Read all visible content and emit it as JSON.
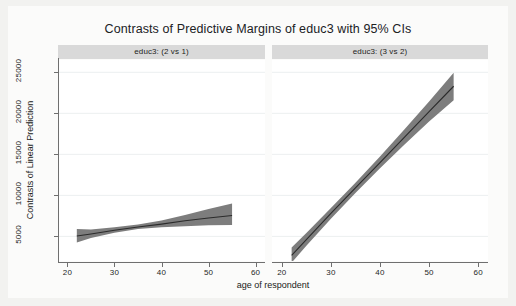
{
  "chart_data": {
    "type": "line",
    "title": "Contrasts of Predictive Margins of educ3 with 95% CIs",
    "xlabel": "age of respondent",
    "ylabel": "Contrasts of Linear Prediction",
    "xlim": [
      18,
      62
    ],
    "ylim": [
      2000,
      26500
    ],
    "xticks": [
      20,
      30,
      40,
      50,
      60
    ],
    "xtick_labels": [
      "20",
      "30",
      "40",
      "50",
      "60"
    ],
    "yticks": [
      5000,
      10000,
      15000,
      20000,
      25000
    ],
    "ytick_labels": [
      "5000",
      "10000",
      "15000",
      "20000",
      "25000"
    ],
    "grid": "horizontal-faint",
    "legend": "none",
    "band_color": "#7d7d7d",
    "line_color": "#2b2b2b",
    "panel_header_bg": "#d9d9d9",
    "panels": [
      {
        "label": "educ3: (2 vs 1)",
        "x": [
          22,
          25,
          30,
          35,
          40,
          45,
          50,
          55
        ],
        "fit": [
          5050,
          5300,
          5750,
          6150,
          6500,
          6900,
          7250,
          7550
        ],
        "ci_low": [
          4250,
          4800,
          5450,
          5900,
          6100,
          6250,
          6350,
          6400
        ],
        "ci_high": [
          5900,
          5850,
          6100,
          6450,
          6950,
          7600,
          8350,
          9000
        ]
      },
      {
        "label": "educ3: (3 vs 2)",
        "x": [
          22,
          25,
          30,
          35,
          40,
          45,
          50,
          55
        ],
        "fit": [
          2700,
          4600,
          7800,
          10900,
          14000,
          17100,
          20200,
          23300
        ],
        "ci_low": [
          1800,
          3850,
          7150,
          10300,
          13300,
          16200,
          19000,
          21600
        ],
        "ci_high": [
          3650,
          5400,
          8450,
          11550,
          14750,
          18050,
          21450,
          24950
        ]
      }
    ]
  }
}
